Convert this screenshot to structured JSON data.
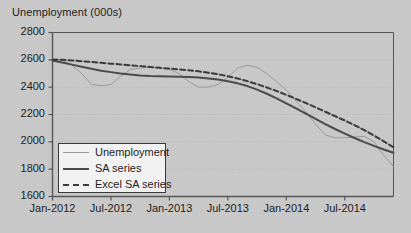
{
  "chart_data": {
    "type": "line",
    "title": "Unemployment (000s)",
    "xlabel": "",
    "ylabel": "",
    "ylim": [
      1600,
      2800
    ],
    "ytick_step": 200,
    "yticks": [
      2800,
      2600,
      2400,
      2200,
      2000,
      1800,
      1600
    ],
    "xticks": [
      "Jan-2012",
      "Jul-2012",
      "Jan-2013",
      "Jul-2013",
      "Jan-2014",
      "Jul-2014"
    ],
    "xlim_months": [
      "2012-01",
      "2014-12"
    ],
    "grid": true,
    "grid_axis": "y",
    "legend_position": "bottom-left",
    "colors": {
      "unemployment": "#9b9b9b",
      "sa_series": "#4a4a4a",
      "excel_sa_series": "#3a3a3a",
      "plot_border": "#555555",
      "gridline": "#b0b0b0",
      "background": "#c8c8c8",
      "legend_background": "#f2f2f2",
      "text": "#1d1d1d"
    },
    "x": [
      "2012-01",
      "2012-02",
      "2012-03",
      "2012-04",
      "2012-05",
      "2012-06",
      "2012-07",
      "2012-08",
      "2012-09",
      "2012-10",
      "2012-11",
      "2012-12",
      "2013-01",
      "2013-02",
      "2013-03",
      "2013-04",
      "2013-05",
      "2013-06",
      "2013-07",
      "2013-08",
      "2013-09",
      "2013-10",
      "2013-11",
      "2013-12",
      "2014-01",
      "2014-02",
      "2014-03",
      "2014-04",
      "2014-05",
      "2014-06",
      "2014-07",
      "2014-08",
      "2014-09",
      "2014-10",
      "2014-11",
      "2014-12"
    ],
    "series": [
      {
        "name": "Unemployment",
        "style": "solid",
        "width": 1,
        "color": "#9b9b9b",
        "values": [
          2610,
          2600,
          2560,
          2500,
          2420,
          2410,
          2420,
          2480,
          2530,
          2540,
          2545,
          2540,
          2530,
          2500,
          2440,
          2400,
          2400,
          2420,
          2470,
          2540,
          2560,
          2545,
          2500,
          2440,
          2380,
          2300,
          2220,
          2130,
          2050,
          2030,
          2030,
          2035,
          2040,
          2000,
          1900,
          1820
        ]
      },
      {
        "name": "SA series",
        "style": "solid",
        "width": 2,
        "color": "#4a4a4a",
        "values": [
          2595,
          2580,
          2565,
          2550,
          2535,
          2520,
          2510,
          2500,
          2492,
          2486,
          2482,
          2480,
          2478,
          2476,
          2474,
          2470,
          2464,
          2456,
          2444,
          2428,
          2408,
          2382,
          2352,
          2318,
          2282,
          2244,
          2206,
          2168,
          2130,
          2094,
          2060,
          2028,
          1998,
          1970,
          1944,
          1920
        ]
      },
      {
        "name": "Excel SA series",
        "style": "dashed",
        "width": 2,
        "color": "#3a3a3a",
        "values": [
          2600,
          2600,
          2596,
          2590,
          2584,
          2578,
          2572,
          2566,
          2560,
          2554,
          2548,
          2542,
          2536,
          2530,
          2524,
          2516,
          2506,
          2494,
          2480,
          2464,
          2444,
          2422,
          2398,
          2372,
          2344,
          2314,
          2284,
          2252,
          2220,
          2188,
          2156,
          2122,
          2086,
          2046,
          2004,
          1960
        ]
      }
    ]
  },
  "legend": {
    "items": [
      {
        "label": "Unemployment"
      },
      {
        "label": "SA series"
      },
      {
        "label": "Excel SA series"
      }
    ]
  }
}
